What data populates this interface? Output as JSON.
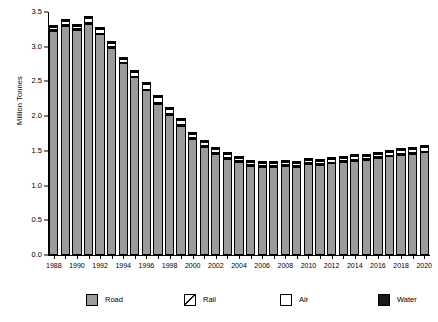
{
  "chart_data": {
    "type": "bar",
    "stacked": true,
    "title": "",
    "xlabel": "",
    "ylabel": "Million Tonnes",
    "ylim": [
      0.0,
      3.5
    ],
    "ytick_labels": [
      "0.0",
      "0.5",
      "1.0",
      "1.5",
      "2.0",
      "2.5",
      "3.0",
      "3.5"
    ],
    "ytick_values": [
      0.0,
      0.5,
      1.0,
      1.5,
      2.0,
      2.5,
      3.0,
      3.5
    ],
    "grid": false,
    "legend_position": "bottom",
    "categories": [
      "1988",
      "1989",
      "1990",
      "1991",
      "1992",
      "1993",
      "1994",
      "1995",
      "1996",
      "1997",
      "1998",
      "1999",
      "2000",
      "2001",
      "2002",
      "2003",
      "2004",
      "2005",
      "2006",
      "2007",
      "2008",
      "2009",
      "2010",
      "2011",
      "2012",
      "2013",
      "2014",
      "2015",
      "2016",
      "2017",
      "2018",
      "2019",
      "2020"
    ],
    "xtick_labels": [
      "1988",
      "1990",
      "1992",
      "1994",
      "1996",
      "1998",
      "2000",
      "2002",
      "2004",
      "2006",
      "2008",
      "2010",
      "2012",
      "2014",
      "2016",
      "2018",
      "2020"
    ],
    "series": [
      {
        "name": "Road",
        "color": "#9b9b9b",
        "pattern": "stipple",
        "values": [
          3.22,
          3.3,
          3.24,
          3.33,
          3.18,
          2.98,
          2.76,
          2.56,
          2.37,
          2.18,
          2.02,
          1.86,
          1.67,
          1.56,
          1.46,
          1.39,
          1.34,
          1.28,
          1.27,
          1.27,
          1.28,
          1.27,
          1.31,
          1.3,
          1.32,
          1.34,
          1.36,
          1.37,
          1.4,
          1.42,
          1.44,
          1.46,
          1.48
        ]
      },
      {
        "name": "Rail",
        "color": "#ffffff",
        "pattern": "diagonal-hatch",
        "values": [
          0.02,
          0.01,
          0.01,
          0.01,
          0.01,
          0.01,
          0.01,
          0.01,
          0.01,
          0.01,
          0.01,
          0.01,
          0.01,
          0.01,
          0.01,
          0.01,
          0.01,
          0.01,
          0.01,
          0.01,
          0.01,
          0.01,
          0.01,
          0.01,
          0.01,
          0.01,
          0.01,
          0.01,
          0.01,
          0.01,
          0.01,
          0.01,
          0.01
        ]
      },
      {
        "name": "Air",
        "color": "#ffffff",
        "pattern": "solid",
        "values": [
          0.04,
          0.06,
          0.05,
          0.07,
          0.06,
          0.06,
          0.06,
          0.07,
          0.08,
          0.08,
          0.08,
          0.08,
          0.07,
          0.06,
          0.05,
          0.05,
          0.05,
          0.05,
          0.05,
          0.05,
          0.05,
          0.05,
          0.05,
          0.05,
          0.05,
          0.05,
          0.05,
          0.05,
          0.05,
          0.05,
          0.06,
          0.06,
          0.06
        ]
      },
      {
        "name": "Water",
        "color": "#1a1a1a",
        "pattern": "solid",
        "values": [
          0.01,
          0.01,
          0.01,
          0.01,
          0.01,
          0.01,
          0.01,
          0.01,
          0.01,
          0.01,
          0.01,
          0.01,
          0.01,
          0.01,
          0.01,
          0.01,
          0.01,
          0.01,
          0.01,
          0.01,
          0.01,
          0.01,
          0.01,
          0.01,
          0.01,
          0.01,
          0.01,
          0.01,
          0.01,
          0.01,
          0.01,
          0.01,
          0.01
        ]
      }
    ],
    "totals": [
      3.29,
      3.38,
      3.31,
      3.42,
      3.26,
      3.06,
      2.84,
      2.65,
      2.47,
      2.28,
      2.12,
      1.96,
      1.76,
      1.64,
      1.53,
      1.46,
      1.41,
      1.35,
      1.34,
      1.34,
      1.35,
      1.34,
      1.38,
      1.37,
      1.39,
      1.41,
      1.43,
      1.44,
      1.47,
      1.49,
      1.52,
      1.54,
      1.56
    ]
  },
  "legend": {
    "items": [
      {
        "label": "Road"
      },
      {
        "label": "Rail"
      },
      {
        "label": "Air"
      },
      {
        "label": "Water"
      }
    ]
  }
}
